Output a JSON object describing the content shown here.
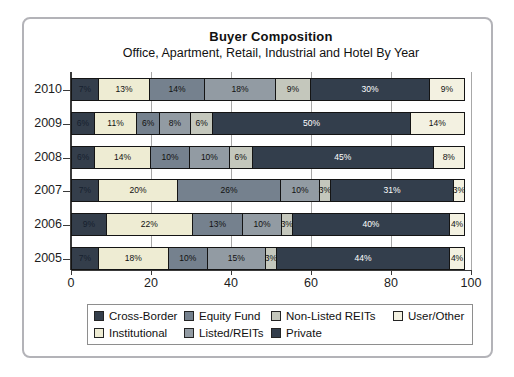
{
  "chart_data": {
    "type": "bar",
    "orientation": "horizontal-stacked",
    "title": "Buyer Composition",
    "subtitle": "Office, Apartment, Retail, Industrial and Hotel By Year",
    "categories": [
      "2010",
      "2009",
      "2008",
      "2007",
      "2006",
      "2005"
    ],
    "xlabel": "",
    "ylabel": "",
    "xlim": [
      0,
      100
    ],
    "xticks": [
      0,
      20,
      40,
      60,
      80,
      100
    ],
    "grid": "vertical",
    "series": [
      {
        "name": "Cross-Border",
        "color": "#343e4b",
        "label_color": "#16202e",
        "values": [
          7,
          6,
          6,
          7,
          9,
          7
        ]
      },
      {
        "name": "Institutional",
        "color": "#eeecd3",
        "label_color": "#111111",
        "values": [
          13,
          11,
          14,
          20,
          22,
          18
        ]
      },
      {
        "name": "Equity Fund",
        "color": "#75818e",
        "label_color": "#111111",
        "values": [
          14,
          6,
          10,
          26,
          13,
          10
        ]
      },
      {
        "name": "Listed/REITs",
        "color": "#929ba3",
        "label_color": "#111111",
        "values": [
          18,
          8,
          10,
          10,
          10,
          15
        ]
      },
      {
        "name": "Non-Listed REITs",
        "color": "#c4c7bc",
        "label_color": "#111111",
        "values": [
          9,
          6,
          6,
          3,
          3,
          3
        ]
      },
      {
        "name": "Private",
        "color": "#333e4c",
        "label_color": "#ffffff",
        "values": [
          30,
          50,
          45,
          31,
          40,
          44
        ]
      },
      {
        "name": "User/Other",
        "color": "#f3f1e1",
        "label_color": "#111111",
        "values": [
          9,
          14,
          8,
          3,
          4,
          4
        ]
      }
    ],
    "value_suffix": "%",
    "legend": {
      "position": "bottom-box",
      "rows": [
        [
          "Cross-Border",
          "Equity Fund",
          "Non-Listed REITs",
          "User/Other"
        ],
        [
          "Institutional",
          "Listed/REITs",
          "Private"
        ]
      ]
    }
  }
}
